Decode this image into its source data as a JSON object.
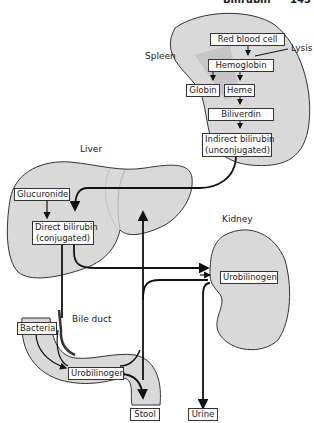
{
  "header": {
    "title": "Bilirubin",
    "page_number": "143"
  },
  "organs": {
    "spleen": "Spleen",
    "liver": "Liver",
    "kidney": "Kidney",
    "bile_duct": "Bile duct"
  },
  "annotations": {
    "lysis": "Lysis"
  },
  "nodes": {
    "red_blood_cell": "Red blood cell",
    "hemoglobin": "Hemoglobin",
    "globin": "Globin",
    "heme": "Heme",
    "biliverdin": "Biliverdin",
    "indirect_bilirubin_1": "Indirect bilirubin",
    "indirect_bilirubin_2": "(unconjugated)",
    "glucuronide": "Glucuronide",
    "direct_bilirubin_1": "Direct bilirubin",
    "direct_bilirubin_2": "(conjugated)",
    "kidney_urobilinogen": "Urobilinogen",
    "bacteria": "Bacteria",
    "intestine_urobilinogen": "Urobilinogen",
    "stool": "Stool",
    "urine": "Urine"
  },
  "colors": {
    "organ_fill": "#d9d9d9",
    "organ_stroke": "#333333",
    "arrow": "#111111",
    "shadow": "#b8b8b8"
  }
}
